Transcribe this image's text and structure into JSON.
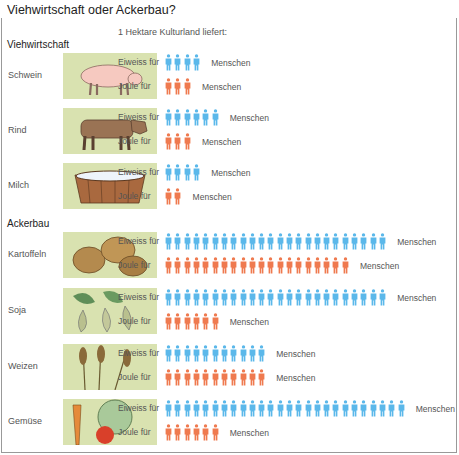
{
  "title": "Viehwirtschaft oder Ackerbau?",
  "subtitle": "1 Hektare Kulturland liefert:",
  "metric_labels": {
    "protein": "Eiweiss für",
    "energy": "Joule für",
    "unit": "Menschen"
  },
  "colors": {
    "protein": "#5bb8ea",
    "energy": "#ef7a4f",
    "picture_bg": "#d9e2b0"
  },
  "sections": [
    {
      "label": "Viehwirtschaft"
    },
    {
      "label": "Ackerbau"
    }
  ],
  "rows": [
    {
      "label": "Schwein",
      "icon": "pig-icon"
    },
    {
      "label": "Rind",
      "icon": "cow-icon"
    },
    {
      "label": "Milch",
      "icon": "milk-tub-icon"
    },
    {
      "label": "Kartoffeln",
      "icon": "potatoes-icon"
    },
    {
      "label": "Soja",
      "icon": "soybean-icon"
    },
    {
      "label": "Weizen",
      "icon": "wheat-icon"
    },
    {
      "label": "Gemüse",
      "icon": "vegetables-icon"
    }
  ],
  "chart_data": {
    "type": "bar",
    "title": "Viehwirtschaft oder Ackerbau?",
    "subtitle": "1 Hektare Kulturland liefert:",
    "categories": [
      "Schwein",
      "Rind",
      "Milch",
      "Kartoffeln",
      "Soja",
      "Weizen",
      "Gemüse"
    ],
    "groups": {
      "Viehwirtschaft": [
        "Schwein",
        "Rind",
        "Milch"
      ],
      "Ackerbau": [
        "Kartoffeln",
        "Soja",
        "Weizen",
        "Gemüse"
      ]
    },
    "series": [
      {
        "name": "Eiweiss für ... Menschen",
        "color": "#5bb8ea",
        "values": [
          4,
          6,
          4,
          24,
          24,
          11,
          26
        ]
      },
      {
        "name": "Joule für ... Menschen",
        "color": "#ef7a4f",
        "values": [
          3,
          3,
          2,
          20,
          6,
          11,
          6
        ]
      }
    ],
    "xlabel": "",
    "ylabel": "Menschen (pictogram count)",
    "orientation": "horizontal",
    "grid": false,
    "legend": "inline labels"
  }
}
